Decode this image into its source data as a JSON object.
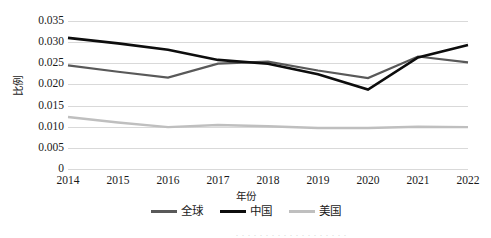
{
  "chart_data": {
    "type": "line",
    "title": "",
    "xlabel": "年份",
    "ylabel": "比例",
    "categories": [
      "2014",
      "2015",
      "2016",
      "2017",
      "2018",
      "2019",
      "2020",
      "2021",
      "2022"
    ],
    "ylim": [
      0,
      0.035
    ],
    "ytick_labels": [
      "0.035",
      "0.030",
      "0.025",
      "0.020",
      "0.015",
      "0.010",
      "0.005",
      "0"
    ],
    "ytick_values": [
      0.035,
      0.03,
      0.025,
      0.02,
      0.015,
      0.01,
      0.005,
      0
    ],
    "grid": true,
    "legend_position": "bottom",
    "series": [
      {
        "name": "全球",
        "color": "#595959",
        "width": 2.2,
        "values": [
          0.0245,
          0.023,
          0.0216,
          0.0249,
          0.0254,
          0.0233,
          0.0215,
          0.0266,
          0.0252
        ]
      },
      {
        "name": "中国",
        "color": "#0d0d0d",
        "width": 2.6,
        "values": [
          0.031,
          0.0297,
          0.0282,
          0.0258,
          0.0249,
          0.0224,
          0.0188,
          0.0264,
          0.0293
        ]
      },
      {
        "name": "美国",
        "color": "#bfbfbf",
        "width": 2.4,
        "values": [
          0.0123,
          0.011,
          0.0099,
          0.0104,
          0.0101,
          0.0097,
          0.0097,
          0.01,
          0.0099
        ]
      }
    ]
  },
  "caption_sliver": ". . .  . . . .  . .   . .  . .  . . . . . ."
}
